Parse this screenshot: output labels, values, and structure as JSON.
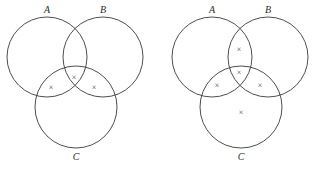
{
  "figure": {
    "type": "venn-diagram-pair",
    "background_color": "#ffffff",
    "stroke_color": "#3a3a3a",
    "label_color": "#2b2b2b",
    "mark_color": "#444444",
    "mark_glyph": "×"
  },
  "diagrams": [
    {
      "id": "left",
      "name": "left-venn-diagram",
      "offset_x": 0,
      "circles": [
        {
          "id": "A",
          "label": "A",
          "cx": 47,
          "cy": 57,
          "r": 40,
          "label_x": 47,
          "label_y": 11
        },
        {
          "id": "B",
          "label": "B",
          "cx": 103,
          "cy": 57,
          "r": 40,
          "label_x": 103,
          "label_y": 11
        },
        {
          "id": "C",
          "label": "C",
          "cx": 76,
          "cy": 107,
          "r": 41,
          "label_x": 76,
          "label_y": 158
        }
      ],
      "marks": [
        {
          "region": "A∩C",
          "name": "mark-a-c",
          "glyph": "×",
          "x": 51,
          "y": 88
        },
        {
          "region": "A∩B∩C",
          "name": "mark-a-b-c",
          "glyph": "×",
          "x": 74,
          "y": 78
        },
        {
          "region": "B∩C",
          "name": "mark-b-c",
          "glyph": "×",
          "x": 94,
          "y": 88
        }
      ],
      "mark_count": 3
    },
    {
      "id": "right",
      "name": "right-venn-diagram",
      "offset_x": 165,
      "circles": [
        {
          "id": "A",
          "label": "A",
          "cx": 47,
          "cy": 57,
          "r": 40,
          "label_x": 47,
          "label_y": 11
        },
        {
          "id": "B",
          "label": "B",
          "cx": 103,
          "cy": 57,
          "r": 40,
          "label_x": 103,
          "label_y": 11
        },
        {
          "id": "C",
          "label": "C",
          "cx": 76,
          "cy": 107,
          "r": 41,
          "label_x": 76,
          "label_y": 158
        }
      ],
      "marks": [
        {
          "region": "A∩B",
          "name": "mark-a-b",
          "glyph": "×",
          "x": 74,
          "y": 50
        },
        {
          "region": "A∩B∩C",
          "name": "mark-a-b-c",
          "glyph": "×",
          "x": 74,
          "y": 73
        },
        {
          "region": "A∩C",
          "name": "mark-a-c",
          "glyph": "×",
          "x": 52,
          "y": 86
        },
        {
          "region": "B∩C",
          "name": "mark-b-c",
          "glyph": "×",
          "x": 95,
          "y": 86
        },
        {
          "region": "C only",
          "name": "mark-c-only",
          "glyph": "×",
          "x": 76,
          "y": 113
        }
      ],
      "mark_count": 5
    }
  ]
}
